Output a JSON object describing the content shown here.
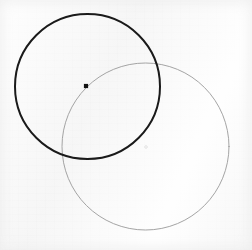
{
  "figure": {
    "canvas": {
      "width": 252,
      "height": 250
    },
    "background_color": "#f8f8f8",
    "shapes": [
      {
        "id": "dark-circle",
        "kind": "circle",
        "label": "Dark circle",
        "cx": 87.5,
        "cy": 86.5,
        "r": 72.5,
        "stroke_color": "#1a1a1a",
        "stroke_width": 2.0,
        "fill": "none"
      },
      {
        "id": "light-circle",
        "kind": "circle",
        "label": "Light circle",
        "cx": 145.5,
        "cy": 146.5,
        "r": 83.5,
        "stroke_color": "#9a9a9a",
        "stroke_width": 0.9,
        "fill": "none"
      }
    ],
    "markers": [
      {
        "id": "dark-center-dot",
        "kind": "square-dot",
        "label": "Dark circle center point",
        "x": 86.0,
        "y": 86.0,
        "size": 4.2,
        "color": "#121212"
      },
      {
        "id": "light-center-dot",
        "kind": "faint-dot",
        "label": "Light circle center point",
        "x": 146.0,
        "y": 147.0,
        "size": 2.6,
        "color": "#dcdcdc"
      }
    ],
    "intersections": [
      {
        "id": "intersection-upper",
        "label": "Upper intersection",
        "x": 152,
        "y": 57
      },
      {
        "id": "intersection-lower",
        "label": "Lower intersection",
        "x": 67,
        "y": 155
      }
    ]
  }
}
